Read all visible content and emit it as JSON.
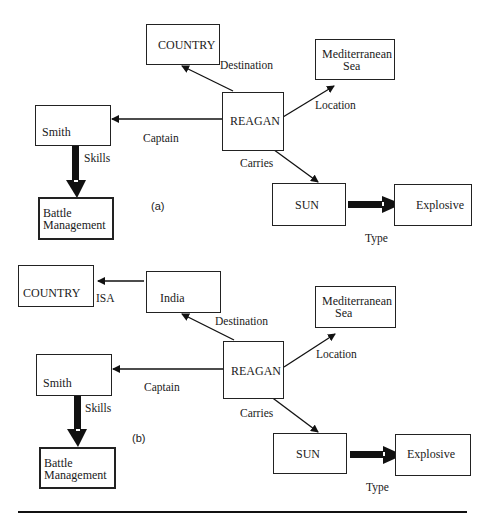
{
  "diagram_a": {
    "caption": "(a)",
    "nodes": {
      "country": "COUNTRY",
      "reagan": "REAGAN",
      "med_line1": "Mediterranean",
      "med_line2": "Sea",
      "smith": "Smith",
      "battle_line1": "Battle",
      "battle_line2": "Management",
      "sun": "SUN",
      "explosive": "Explosive"
    },
    "edges": {
      "destination": "Destination",
      "location": "Location",
      "captain": "Captain",
      "carries": "Carries",
      "skills": "Skills",
      "type": "Type"
    }
  },
  "diagram_b": {
    "caption": "(b)",
    "nodes": {
      "country": "COUNTRY",
      "india": "India",
      "reagan": "REAGAN",
      "med_line1": "Mediterranean",
      "med_line2": "Sea",
      "smith": "Smith",
      "battle_line1": "Battle",
      "battle_line2": "Management",
      "sun": "SUN",
      "explosive": "Explosive"
    },
    "edges": {
      "isa": "ISA",
      "destination": "Destination",
      "location": "Location",
      "captain": "Captain",
      "carries": "Carries",
      "skills": "Skills",
      "type": "Type"
    }
  }
}
